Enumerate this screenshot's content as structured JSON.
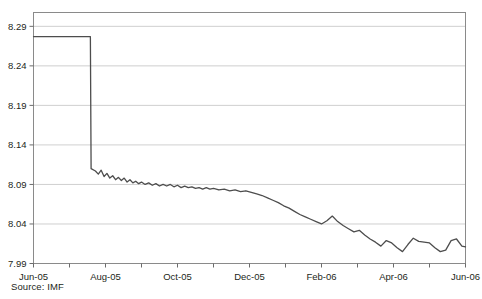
{
  "chart_data": {
    "type": "line",
    "title": "",
    "subtitle": "",
    "xlabel": "",
    "ylabel": "",
    "ylim": [
      7.99,
      8.3075
    ],
    "xlim": [
      "Jun-05",
      "Jun-06"
    ],
    "grid": true,
    "legend": null,
    "yticks": [
      "8.29",
      "8.24",
      "8.19",
      "8.14",
      "8.09",
      "8.04",
      "7.99"
    ],
    "ytick_values": [
      8.29,
      8.24,
      8.19,
      8.14,
      8.09,
      8.04,
      7.99
    ],
    "xticks": [
      "Jun-05",
      "Aug-05",
      "Oct-05",
      "Dec-05",
      "Feb-06",
      "Apr-06",
      "Jun-06"
    ],
    "xtick_positions": [
      0,
      2,
      4,
      6,
      8,
      10,
      12
    ],
    "xminor_count": 13,
    "line_color": "#4d4d4d",
    "series": [
      {
        "name": "CNY per USD",
        "x": [
          0,
          0.2,
          0.4,
          0.6,
          0.8,
          1.0,
          1.2,
          1.4,
          1.58,
          1.6,
          1.72,
          1.8,
          1.88,
          1.96,
          2.04,
          2.12,
          2.2,
          2.28,
          2.36,
          2.44,
          2.52,
          2.6,
          2.68,
          2.76,
          2.84,
          2.92,
          3.0,
          3.1,
          3.2,
          3.3,
          3.4,
          3.5,
          3.6,
          3.7,
          3.8,
          3.9,
          4.0,
          4.1,
          4.2,
          4.3,
          4.4,
          4.5,
          4.6,
          4.7,
          4.8,
          4.9,
          5.0,
          5.15,
          5.3,
          5.45,
          5.6,
          5.75,
          5.9,
          6.05,
          6.2,
          6.35,
          6.5,
          6.65,
          6.8,
          6.95,
          7.1,
          7.25,
          7.4,
          7.55,
          7.7,
          7.85,
          8.0,
          8.15,
          8.3,
          8.45,
          8.6,
          8.75,
          8.9,
          9.05,
          9.2,
          9.35,
          9.5,
          9.65,
          9.8,
          9.95,
          10.1,
          10.25,
          10.4,
          10.55,
          10.7,
          10.85,
          11.0,
          11.15,
          11.3,
          11.45,
          11.6,
          11.75,
          11.9,
          12.0
        ],
        "values": [
          8.277,
          8.277,
          8.277,
          8.277,
          8.277,
          8.277,
          8.277,
          8.277,
          8.277,
          8.11,
          8.107,
          8.103,
          8.108,
          8.1,
          8.104,
          8.098,
          8.101,
          8.096,
          8.099,
          8.095,
          8.098,
          8.093,
          8.096,
          8.092,
          8.094,
          8.091,
          8.093,
          8.09,
          8.092,
          8.089,
          8.091,
          8.088,
          8.09,
          8.088,
          8.09,
          8.087,
          8.089,
          8.086,
          8.088,
          8.086,
          8.087,
          8.085,
          8.086,
          8.084,
          8.086,
          8.084,
          8.085,
          8.083,
          8.084,
          8.082,
          8.083,
          8.081,
          8.082,
          8.08,
          8.078,
          8.076,
          8.073,
          8.07,
          8.067,
          8.063,
          8.06,
          8.056,
          8.052,
          8.049,
          8.046,
          8.043,
          8.04,
          8.044,
          8.05,
          8.043,
          8.038,
          8.034,
          8.03,
          8.032,
          8.026,
          8.021,
          8.017,
          8.012,
          8.019,
          8.016,
          8.01,
          8.005,
          8.014,
          8.022,
          8.018,
          8.017,
          8.016,
          8.01,
          8.005,
          8.007,
          8.019,
          8.021,
          8.012,
          8.011
        ]
      }
    ]
  },
  "footer": {
    "source": "Source: IMF"
  }
}
